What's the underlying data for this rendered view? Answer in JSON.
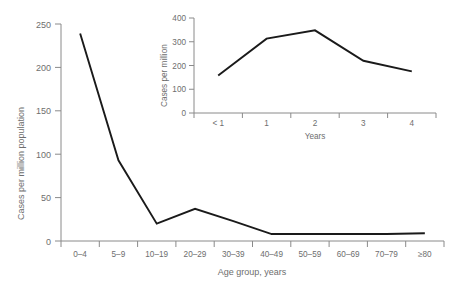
{
  "chart_data": [
    {
      "id": "main",
      "type": "line",
      "title": "",
      "xlabel": "Age group, years",
      "ylabel": "Cases per million population",
      "categories": [
        "0–4",
        "5–9",
        "10–19",
        "20–29",
        "30–39",
        "40–49",
        "50–59",
        "60–69",
        "70–79",
        "≥80"
      ],
      "values": [
        239,
        93,
        20,
        37,
        23,
        8,
        8,
        8,
        8,
        9
      ],
      "ylim": [
        0,
        250
      ],
      "yticks": [
        0,
        50,
        100,
        150,
        200,
        250
      ],
      "ytick_labels": [
        "0",
        "50",
        "100",
        "150",
        "200",
        "250"
      ],
      "grid": false,
      "legend": "none"
    },
    {
      "id": "inset",
      "type": "line",
      "title": "",
      "xlabel": "Years",
      "ylabel": "Cases per million",
      "categories": [
        "< 1",
        "1",
        "2",
        "3",
        "4"
      ],
      "values": [
        158,
        313,
        348,
        220,
        175
      ],
      "ylim": [
        0,
        400
      ],
      "yticks": [
        0,
        100,
        200,
        300,
        400
      ],
      "ytick_labels": [
        "0",
        "100",
        "200",
        "300",
        "400"
      ],
      "grid": false,
      "legend": "none"
    }
  ],
  "colors": {
    "line": "#1a1a1a",
    "axis": "#8a8a8a",
    "text": "#6e6e6e",
    "background": "#ffffff"
  }
}
